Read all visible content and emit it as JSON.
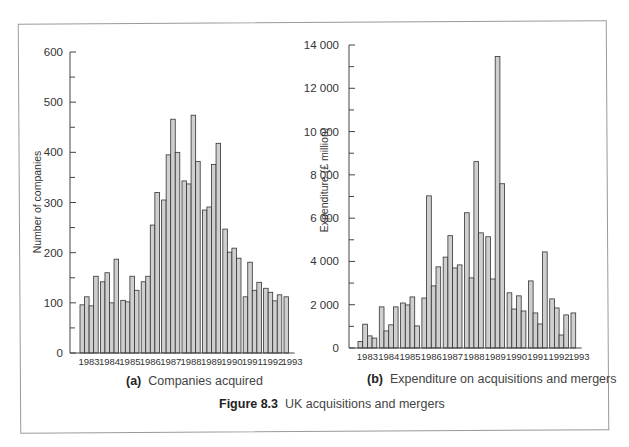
{
  "figure": {
    "label": "Figure 8.3",
    "title": "UK acquisitions and mergers"
  },
  "style": {
    "bar_fill": "#cfcfcf",
    "bar_stroke": "#333333",
    "axis_color": "#444444"
  },
  "panels": [
    {
      "tag": "(a)",
      "caption": "Companies acquired"
    },
    {
      "tag": "(b)",
      "caption": "Expenditure on acquisitions and mergers"
    }
  ],
  "chart_data": [
    {
      "type": "bar",
      "title": "(a) Companies acquired",
      "xlabel": "",
      "ylabel": "Number of companies",
      "ylim": [
        0,
        600
      ],
      "yticks": [
        0,
        100,
        200,
        300,
        400,
        500,
        600
      ],
      "ytick_labels": [
        "0",
        "100",
        "200",
        "300",
        "400",
        "500",
        "600"
      ],
      "grid": false,
      "frequency": "quarterly",
      "categories": [
        "1983",
        "1984",
        "1985",
        "1986",
        "1987",
        "1988",
        "1989",
        "1990",
        "1991",
        "1992",
        "1993"
      ],
      "quarters_per_year": [
        4,
        4,
        4,
        4,
        4,
        4,
        4,
        4,
        4,
        4,
        1
      ],
      "values": [
        96,
        112,
        94,
        153,
        142,
        160,
        100,
        187,
        105,
        102,
        153,
        125,
        142,
        153,
        255,
        320,
        305,
        395,
        466,
        400,
        343,
        337,
        474,
        382,
        285,
        291,
        376,
        418,
        247,
        201,
        209,
        189,
        112,
        181,
        125,
        141,
        129,
        121,
        104,
        116,
        112
      ]
    },
    {
      "type": "bar",
      "title": "(b) Expenditure on acquisitions and mergers",
      "xlabel": "",
      "ylabel": "Expenditure (£ million)",
      "ylim": [
        0,
        14000
      ],
      "yticks": [
        0,
        2000,
        4000,
        6000,
        8000,
        10000,
        12000,
        14000
      ],
      "ytick_labels": [
        "0",
        "2 000",
        "4 000",
        "6 000",
        "8 000",
        "10 000",
        "12 000",
        "14 000"
      ],
      "grid": false,
      "frequency": "quarterly",
      "categories": [
        "1983",
        "1984",
        "1985",
        "1986",
        "1987",
        "1988",
        "1989",
        "1990",
        "1991",
        "1992",
        "1993"
      ],
      "quarters_per_year": [
        4,
        4,
        4,
        4,
        4,
        4,
        4,
        4,
        4,
        4,
        1
      ],
      "values": [
        300,
        1100,
        560,
        460,
        1900,
        790,
        1070,
        1900,
        2080,
        1990,
        2360,
        1020,
        2310,
        7030,
        2870,
        3750,
        4200,
        5190,
        3700,
        3840,
        6250,
        3240,
        8610,
        5320,
        5140,
        3190,
        13470,
        7590,
        2550,
        1800,
        2410,
        1710,
        3100,
        1620,
        1110,
        4440,
        2270,
        1850,
        600,
        1530,
        1620
      ]
    }
  ]
}
